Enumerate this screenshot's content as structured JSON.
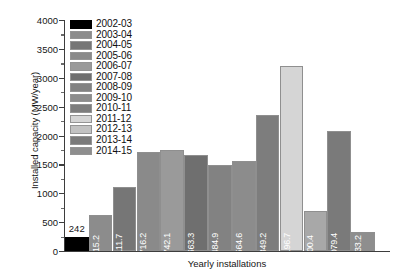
{
  "chart_data": {
    "type": "bar",
    "title": "",
    "xlabel": "Yearly installations",
    "ylabel": "Installed capacity (MW/year)",
    "ylim": [
      0,
      4000
    ],
    "ytick_step": 500,
    "yticks": [
      0,
      500,
      1000,
      1500,
      2000,
      2500,
      3000,
      3500,
      4000
    ],
    "ytick_labels": [
      "0",
      "500",
      "1000",
      "1500",
      "2000",
      "2500",
      "3000",
      "3500",
      "4000"
    ],
    "minor_ticks": true,
    "grid": false,
    "legend_position": "top-left-inside",
    "categories": [
      "2002-03",
      "2003-04",
      "2004-05",
      "2005-06",
      "2006-07",
      "2007-08",
      "2008-09",
      "2009-10",
      "2010-11",
      "2011-12",
      "2012-13",
      "2013-14",
      "2014-15"
    ],
    "values": [
      242,
      615.2,
      1111.7,
      1716.2,
      1742.1,
      1663.3,
      1484.9,
      1564.6,
      2349.2,
      3196.7,
      700.4,
      2079.4,
      333.2
    ],
    "value_labels": [
      "242",
      "615.2",
      "1111.7",
      "1716.2",
      "1742.1",
      "1663.3",
      "1484.9",
      "1564.6",
      "2349.2",
      "3196.7",
      "700.4",
      "2079.4",
      "333.2"
    ],
    "bar_colors": [
      "#000000",
      "#8c8c8c",
      "#767676",
      "#8a8a8a",
      "#9a9a9a",
      "#6f6f6f",
      "#828282",
      "#8c8c8c",
      "#7d7d7d",
      "#d5d5d5",
      "#a8a8a8",
      "#7a7a7a",
      "#8e8e8e"
    ],
    "label_placement": [
      "outside",
      "inside",
      "inside",
      "inside",
      "inside",
      "inside",
      "inside",
      "inside",
      "inside",
      "inside",
      "inside",
      "inside",
      "inside"
    ]
  },
  "legend": {
    "items": [
      {
        "label": "2002-03",
        "color": "#000000"
      },
      {
        "label": "2003-04",
        "color": "#8c8c8c"
      },
      {
        "label": "2004-05",
        "color": "#767676"
      },
      {
        "label": "2005-06",
        "color": "#8a8a8a"
      },
      {
        "label": "2006-07",
        "color": "#9a9a9a"
      },
      {
        "label": "2007-08",
        "color": "#6f6f6f"
      },
      {
        "label": "2008-09",
        "color": "#828282"
      },
      {
        "label": "2009-10",
        "color": "#8c8c8c"
      },
      {
        "label": "2010-11",
        "color": "#7d7d7d"
      },
      {
        "label": "2011-12",
        "color": "#d5d5d5"
      },
      {
        "label": "2012-13",
        "color": "#c2c2c2"
      },
      {
        "label": "2013-14",
        "color": "#7a7a7a"
      },
      {
        "label": "2014-15",
        "color": "#8e8e8e"
      }
    ]
  }
}
